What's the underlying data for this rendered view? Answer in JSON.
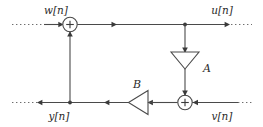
{
  "diagram": {
    "canvas": {
      "width": 263,
      "height": 127
    },
    "colors": {
      "background": "#ffffff",
      "wire": "#4a4a4a",
      "dotted_wire": "#6e6e6e",
      "text": "#2b2b2b",
      "node_fill": "#ffffff",
      "junction": "#3a3a3a"
    },
    "signals": {
      "top_input": "w[n]",
      "top_output": "u[n]",
      "bottom_output": "y[n]",
      "bottom_input": "v[n]"
    },
    "gains": {
      "vertical_amplifier": "A",
      "horizontal_amplifier": "B"
    },
    "adders": {
      "top_operator": "+",
      "bottom_operator": "+"
    },
    "node_labels": {
      "top_adder": "top-summing-junction",
      "bottom_adder": "bottom-summing-junction",
      "amp_a": "amplifier-a",
      "amp_b": "amplifier-b"
    }
  }
}
